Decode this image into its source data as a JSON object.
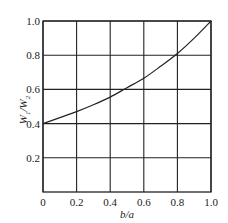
{
  "chart_data": {
    "type": "line",
    "title": "",
    "xlabel": "b/a",
    "ylabel": "W1/W2",
    "xlim": [
      0,
      1.0
    ],
    "ylim": [
      0,
      1.0
    ],
    "x_ticks": [
      "0",
      "0.2",
      "0.4",
      "0.6",
      "0.8",
      "1.0"
    ],
    "y_ticks": [
      "0.2",
      "0.4",
      "0.6",
      "0.8",
      "1.0"
    ],
    "grid": true,
    "legend": null,
    "series": [
      {
        "name": "W1/W2",
        "x": [
          0,
          0.1,
          0.2,
          0.3,
          0.4,
          0.5,
          0.6,
          0.7,
          0.8,
          0.9,
          1.0
        ],
        "values": [
          0.4,
          0.435,
          0.47,
          0.51,
          0.555,
          0.61,
          0.665,
          0.735,
          0.81,
          0.9,
          1.0
        ]
      }
    ],
    "line_color": "#222222"
  },
  "axes": {
    "x_label_main": "b/a",
    "y_label_main": "W",
    "y_label_sub1": "1",
    "y_label_sep": "/W",
    "y_label_sub2": "2"
  }
}
